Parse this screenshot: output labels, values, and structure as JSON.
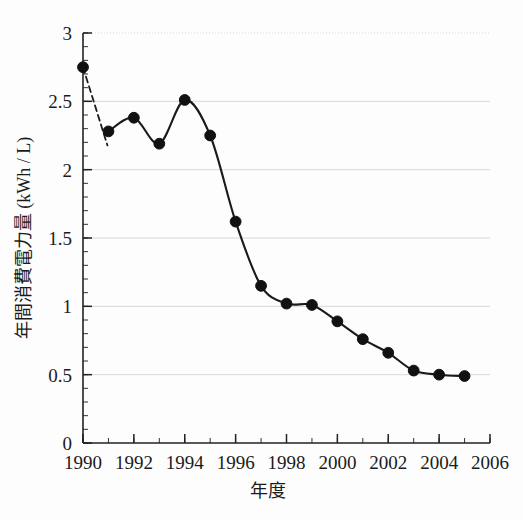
{
  "chart_data": {
    "type": "line",
    "title": "",
    "xlabel": "年度",
    "ylabel": "年間消費電力量 (kWh / L)",
    "xlim": [
      1990,
      2006
    ],
    "ylim": [
      0,
      3
    ],
    "grid": true,
    "grid_orientation": "horizontal",
    "legend": "none",
    "marker": "filled-circle",
    "line_color": "#1a1a1a",
    "marker_color": "#111111",
    "grid_color": "#d8d8d8",
    "x": [
      1990,
      1991,
      1992,
      1993,
      1994,
      1995,
      1996,
      1997,
      1998,
      1999,
      2000,
      2001,
      2002,
      2003,
      2004,
      2005
    ],
    "values": [
      2.75,
      2.28,
      2.38,
      2.19,
      2.51,
      2.25,
      1.62,
      1.15,
      1.02,
      1.01,
      0.89,
      0.76,
      0.66,
      0.53,
      0.5,
      0.49
    ],
    "xticks": [
      1990,
      1992,
      1994,
      1996,
      1998,
      2000,
      2002,
      2004,
      2006
    ],
    "xticklabels": [
      "1990",
      "1992",
      "1994",
      "1996",
      "1998",
      "2000",
      "2002",
      "2004",
      "2006"
    ],
    "xminor_step": 1,
    "yticks": [
      0,
      0.5,
      1,
      1.5,
      2,
      2.5,
      3
    ],
    "yticklabels": [
      "0",
      "0.5",
      "1",
      "1.5",
      "2",
      "2.5",
      "3"
    ],
    "yminor_step": 0.1,
    "segments": [
      {
        "name": "dashed-lead-in",
        "style": "dashed",
        "from_x": 1990,
        "to_x": 1991
      },
      {
        "name": "solid-main",
        "style": "solid",
        "from_x": 1991,
        "to_x": 2005
      }
    ]
  }
}
